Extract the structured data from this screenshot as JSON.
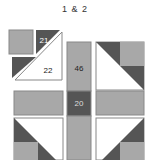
{
  "title": "1 & 2",
  "colors": {
    "medium": "#a8a8a8",
    "dark": "#555555",
    "light": "#ffffff",
    "outline": "#9a9a9a"
  },
  "pieces": {
    "top_left_square": {
      "label": ""
    },
    "corner_triangle_21": {
      "label": "21"
    },
    "large_triangle_22": {
      "label": "22"
    },
    "center_bar_46": {
      "label": "46"
    },
    "center_square_20": {
      "label": "20"
    }
  }
}
